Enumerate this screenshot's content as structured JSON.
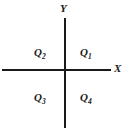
{
  "diagram": {
    "background_color": "#ffffff",
    "line_color": "#1a1a1a",
    "text_color": "#1a1a1a",
    "axes": {
      "x": {
        "label": "X",
        "orientation": "horizontal",
        "label_position": "right-end"
      },
      "y": {
        "label": "Y",
        "orientation": "vertical",
        "label_position": "top-end"
      },
      "origin": {
        "x": 65,
        "y": 70
      }
    },
    "quadrants": [
      {
        "id": "quadrant-1",
        "symbol": "Q",
        "subscript": "1",
        "full_label": "Q1",
        "position": "upper-right"
      },
      {
        "id": "quadrant-2",
        "symbol": "Q",
        "subscript": "2",
        "full_label": "Q2",
        "position": "upper-left"
      },
      {
        "id": "quadrant-3",
        "symbol": "Q",
        "subscript": "3",
        "full_label": "Q3",
        "position": "lower-left"
      },
      {
        "id": "quadrant-4",
        "symbol": "Q",
        "subscript": "4",
        "full_label": "Q4",
        "position": "lower-right"
      }
    ]
  }
}
